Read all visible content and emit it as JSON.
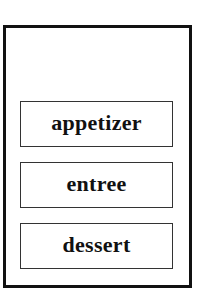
{
  "diagram": {
    "container": {
      "label": "",
      "border_color": "#111111"
    },
    "items": [
      {
        "label": "appetizer"
      },
      {
        "label": "entree"
      },
      {
        "label": "dessert"
      }
    ]
  }
}
